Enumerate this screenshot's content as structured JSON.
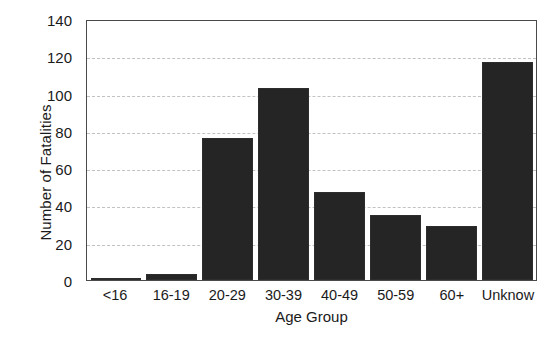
{
  "chart_data": {
    "type": "bar",
    "title": "",
    "xlabel": "Age Group",
    "ylabel": "Number of Fatalities",
    "categories": [
      "<16",
      "16-19",
      "20-29",
      "30-39",
      "40-49",
      "50-59",
      "60+",
      "Unknow"
    ],
    "values": [
      1,
      3,
      76,
      103,
      47,
      35,
      29,
      117
    ],
    "ylim": [
      0,
      140
    ],
    "ytick_values": [
      0,
      20,
      40,
      60,
      80,
      100,
      120,
      140
    ],
    "ytick_labels": [
      "0",
      "20",
      "40",
      "60",
      "80",
      "100",
      "120",
      "140"
    ],
    "grid": true,
    "grid_axis": "y",
    "grid_style": "dashed",
    "grid_color": "#c2c2c2",
    "legend": false,
    "bar_color": "#252525",
    "axis_color": "#4a4a4a",
    "background_color": "#ffffff"
  }
}
